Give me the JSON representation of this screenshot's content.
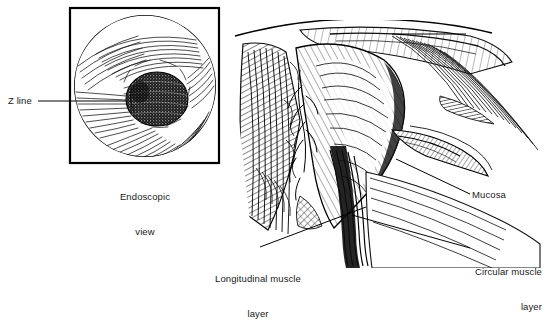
{
  "figure": {
    "type": "medical-illustration",
    "background_color": "#ffffff",
    "ink_color": "#000000"
  },
  "inset": {
    "name": "endoscopic-view",
    "caption_line1": "Endoscopic",
    "caption_line2": "view",
    "frame": {
      "x": 70,
      "y": 8,
      "width": 149,
      "height": 155
    },
    "circle": {
      "cx": 145,
      "cy": 86,
      "r": 71
    },
    "lumen": {
      "cx": 157,
      "cy": 99,
      "rx": 31,
      "ry": 27
    }
  },
  "labels": {
    "z_line": "Z line",
    "mucosa": "Mucosa",
    "longitudinal_line1": "Longitudinal muscle",
    "longitudinal_line2": "layer",
    "circular_line1": "Circular muscle",
    "circular_line2": "layer"
  },
  "leaders": [
    {
      "name": "z-line-leader",
      "x1": 38,
      "y1": 101,
      "x2": 126,
      "y2": 101
    },
    {
      "name": "mucosa-leader",
      "x1": 396,
      "y1": 159,
      "x2": 470,
      "y2": 194
    },
    {
      "name": "longitudinal-leader",
      "x1": 260,
      "y1": 247,
      "x2": 366,
      "y2": 207
    },
    {
      "name": "circular-leader",
      "x1": 352,
      "y1": 215,
      "x2": 470,
      "y2": 248
    },
    {
      "name": "top-rule",
      "x1": 392,
      "y1": 34,
      "x2": 466,
      "y2": 34
    }
  ]
}
